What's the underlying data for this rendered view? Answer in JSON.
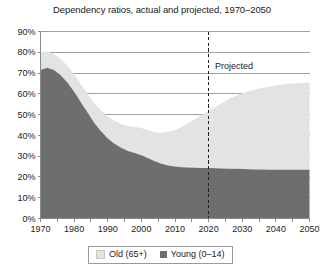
{
  "chart_data": {
    "type": "area",
    "title": "Dependency ratios, actual and projected, 1970–2050",
    "xlabel": "",
    "ylabel": "",
    "stacked": true,
    "grid": true,
    "legend_position": "bottom",
    "xlim": [
      1970,
      2050
    ],
    "ylim": [
      0,
      0.9
    ],
    "xticks": [
      "1970",
      "1980",
      "1990",
      "2000",
      "2010",
      "2020",
      "2030",
      "2040",
      "2050"
    ],
    "yticks": [
      "0%",
      "10%",
      "20%",
      "30%",
      "40%",
      "50%",
      "60%",
      "70%",
      "80%",
      "90%"
    ],
    "ytick_values": [
      0,
      10,
      20,
      30,
      40,
      50,
      60,
      70,
      80,
      90
    ],
    "annotations": [
      {
        "text": "Projected",
        "x": 2021,
        "y": 72,
        "type": "text"
      },
      {
        "text": "",
        "x": 2020,
        "type": "vline-dashed"
      }
    ],
    "x": [
      1970,
      1972,
      1974,
      1976,
      1978,
      1980,
      1982,
      1984,
      1986,
      1988,
      1990,
      1992,
      1994,
      1996,
      1998,
      2000,
      2002,
      2004,
      2006,
      2008,
      2010,
      2012,
      2014,
      2016,
      2018,
      2020,
      2022,
      2024,
      2026,
      2028,
      2030,
      2032,
      2034,
      2036,
      2038,
      2040,
      2042,
      2044,
      2046,
      2048,
      2050
    ],
    "series": [
      {
        "name": "Young (0–14)",
        "color": "#6e6e6e",
        "values": [
          71.5,
          72.5,
          71.5,
          69.0,
          65.5,
          61.0,
          56.0,
          51.0,
          46.0,
          42.0,
          38.5,
          36.0,
          34.0,
          32.5,
          31.5,
          30.5,
          29.0,
          27.5,
          26.3,
          25.5,
          25.0,
          24.7,
          24.5,
          24.4,
          24.3,
          24.3,
          24.2,
          24.1,
          24.0,
          23.9,
          23.8,
          23.7,
          23.6,
          23.6,
          23.5,
          23.5,
          23.5,
          23.5,
          23.5,
          23.5,
          23.5
        ]
      },
      {
        "name": "Old (65+)",
        "color": "#e3e3e3",
        "values": [
          8.5,
          8.0,
          7.8,
          7.8,
          8.0,
          8.3,
          8.6,
          9.0,
          9.5,
          10.0,
          10.5,
          11.0,
          11.5,
          12.0,
          12.5,
          13.0,
          13.5,
          14.0,
          15.0,
          16.2,
          17.5,
          19.5,
          21.5,
          23.5,
          25.5,
          27.5,
          29.5,
          31.5,
          33.5,
          35.0,
          36.5,
          37.5,
          38.5,
          39.3,
          40.0,
          40.5,
          41.0,
          41.3,
          41.6,
          41.8,
          42.0
        ]
      }
    ],
    "totals_note": "",
    "series_order_bottom_to_top": [
      "Young (0–14)",
      "Old (65+)"
    ]
  },
  "legend": {
    "items": [
      {
        "label": "Old (65+)",
        "color": "#e3e3e3"
      },
      {
        "label": "Young (0–14)",
        "color": "#6e6e6e"
      }
    ]
  },
  "colors": {
    "young": "#6e6e6e",
    "old": "#e3e3e3",
    "axis": "#8a8a8a",
    "grid": "#8a8a8a",
    "text": "#222222",
    "background": "#ffffff"
  }
}
